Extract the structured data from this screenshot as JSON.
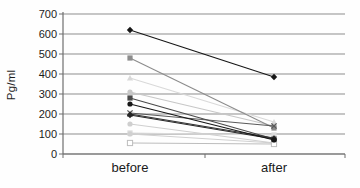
{
  "figure_title": "",
  "chart_data": {
    "type": "line",
    "subtype": "paired-slope",
    "title": "",
    "xlabel": "",
    "ylabel": "Pg/ml",
    "categories": [
      "before",
      "after"
    ],
    "ylim": [
      0,
      700
    ],
    "yticks": [
      700,
      600,
      500,
      400,
      300,
      200,
      100,
      0
    ],
    "grid": true,
    "legend_position": "none",
    "axis_color": "#6e6e6e",
    "gridline_color": "#8d8d8d",
    "tick_label_color": "#1c1c1c",
    "series": [
      {
        "name": "pair-1",
        "values": [
          620,
          385
        ],
        "color": "#161616",
        "marker": "diamond"
      },
      {
        "name": "pair-2",
        "values": [
          480,
          130
        ],
        "color": "#8c8c8c",
        "marker": "square"
      },
      {
        "name": "pair-3",
        "values": [
          380,
          160
        ],
        "color": "#d9d9d9",
        "marker": "triangle"
      },
      {
        "name": "pair-4",
        "values": [
          310,
          140
        ],
        "color": "#c7c7c7",
        "marker": "circle"
      },
      {
        "name": "pair-5",
        "values": [
          280,
          75
        ],
        "color": "#4a4a4a",
        "marker": "square"
      },
      {
        "name": "pair-6",
        "values": [
          250,
          70
        ],
        "color": "#161616",
        "marker": "circle"
      },
      {
        "name": "pair-7",
        "values": [
          205,
          140
        ],
        "color": "#5a5a5a",
        "marker": "x"
      },
      {
        "name": "pair-8",
        "values": [
          200,
          80
        ],
        "color": "#303030",
        "marker": "triangle"
      },
      {
        "name": "pair-9",
        "values": [
          195,
          75
        ],
        "color": "#262626",
        "marker": "diamond"
      },
      {
        "name": "pair-10",
        "values": [
          150,
          55
        ],
        "color": "#cfcfcf",
        "marker": "circle"
      },
      {
        "name": "pair-11",
        "values": [
          105,
          95
        ],
        "color": "#dadada",
        "marker": "square"
      },
      {
        "name": "pair-12",
        "values": [
          100,
          55
        ],
        "color": "#d0d0d0",
        "marker": "circle"
      },
      {
        "name": "pair-13",
        "values": [
          55,
          50
        ],
        "color": "#bdbdbd",
        "marker": "open-square"
      }
    ]
  }
}
